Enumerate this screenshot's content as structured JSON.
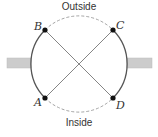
{
  "diagram": {
    "labels": {
      "top": "Outside",
      "bottom": "Inside"
    },
    "points": [
      {
        "id": "B",
        "label": "B"
      },
      {
        "id": "C",
        "label": "C"
      },
      {
        "id": "A",
        "label": "A"
      },
      {
        "id": "D",
        "label": "D"
      }
    ],
    "connections": [
      {
        "from": "B",
        "to": "D",
        "style": "solid"
      },
      {
        "from": "C",
        "to": "A",
        "style": "solid"
      }
    ],
    "arcs": [
      {
        "between": [
          "B",
          "C"
        ],
        "side": "top",
        "style": "dashed"
      },
      {
        "between": [
          "A",
          "D"
        ],
        "side": "bottom",
        "style": "dashed"
      },
      {
        "between": [
          "B",
          "A"
        ],
        "side": "left",
        "style": "solid"
      },
      {
        "between": [
          "C",
          "D"
        ],
        "side": "right",
        "style": "solid"
      }
    ],
    "colors": {
      "line": "#555555",
      "dashed": "#999999",
      "point": "#111111",
      "bar": "#c8c8c8"
    }
  }
}
